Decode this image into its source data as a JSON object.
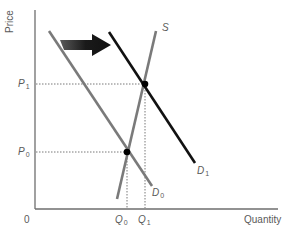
{
  "diagram": {
    "title": "",
    "axes": {
      "y_label": "Price",
      "x_label": "Quantity",
      "origin_label": "0"
    },
    "price_levels": [
      {
        "id": "P1",
        "symbol": "P",
        "subscript": "1"
      },
      {
        "id": "P0",
        "symbol": "P",
        "subscript": "0"
      }
    ],
    "quantity_levels": [
      {
        "id": "Q0",
        "symbol": "Q",
        "subscript": "0"
      },
      {
        "id": "Q1",
        "symbol": "Q",
        "subscript": "1"
      }
    ],
    "curves": [
      {
        "id": "D0",
        "symbol": "D",
        "subscript": "0",
        "type": "demand",
        "color": "#7a7a7a"
      },
      {
        "id": "D1",
        "symbol": "D",
        "subscript": "1",
        "type": "demand",
        "color": "#111111"
      },
      {
        "id": "S",
        "symbol": "S",
        "subscript": "",
        "type": "supply",
        "color": "#7a7a7a"
      }
    ],
    "equilibria": [
      {
        "id": "E0",
        "price": "P0",
        "quantity": "Q0"
      },
      {
        "id": "E1",
        "price": "P1",
        "quantity": "Q1"
      }
    ],
    "shift_arrow": {
      "direction": "right",
      "meaning": "demand increases from D0 to D1",
      "color": "#1a1a1a"
    },
    "colors": {
      "axis": "#6e6e6e",
      "guide": "#555555",
      "point": "#000000",
      "text": "#5a5a5a"
    }
  }
}
